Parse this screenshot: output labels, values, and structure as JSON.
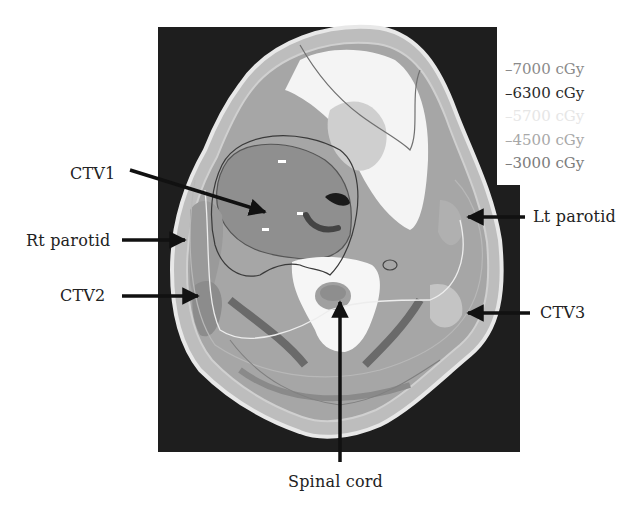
{
  "figure": {
    "type": "CT axial slice with dose contours and anatomical labels",
    "background": "#ffffff",
    "ct_frame_color": "#1e1e1e"
  },
  "legend": {
    "items": [
      {
        "label": "–7000 cGy",
        "color": "#8a8a8a"
      },
      {
        "label": "–6300 cGy",
        "color": "#2a2a2a"
      },
      {
        "label": "–5700 cGy",
        "color": "#e6e6e6"
      },
      {
        "label": "–4500 cGy",
        "color": "#a8a8a8"
      },
      {
        "label": "–3000 cGy",
        "color": "#7c7c7c"
      }
    ]
  },
  "labels": {
    "ctv1": "CTV1",
    "rt_parotid": "Rt parotid",
    "ctv2": "CTV2",
    "lt_parotid": "Lt parotid",
    "ctv3": "CTV3",
    "spinal_cord": "Spinal cord"
  }
}
